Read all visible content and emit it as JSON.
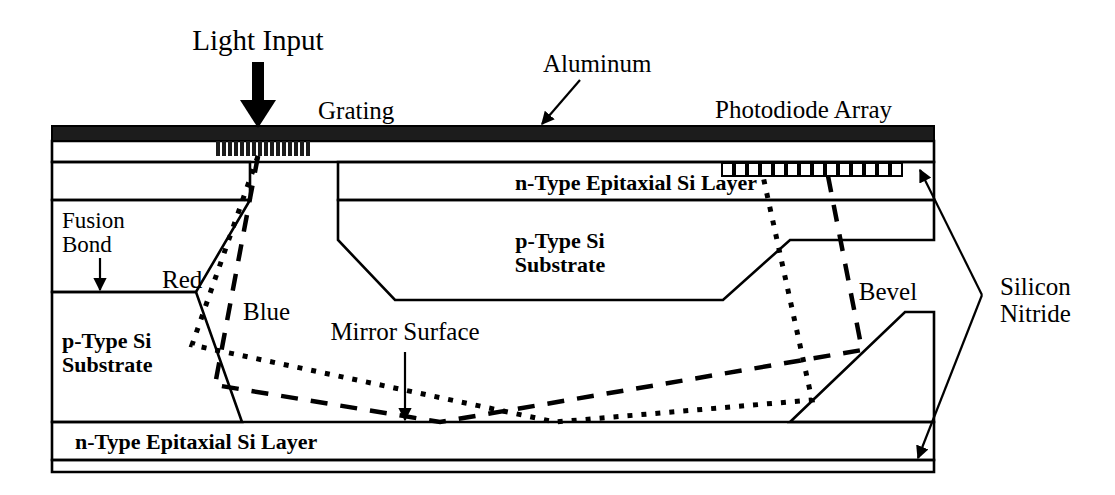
{
  "figure": {
    "kind": "cross-section-schematic",
    "background_color": "#ffffff",
    "ink_color": "#000000"
  },
  "labels": {
    "light_input": "Light Input",
    "grating": "Grating",
    "aluminum": "Aluminum",
    "photodiode_array": "Photodiode Array",
    "epi_top": "n-Type Epitaxial Si Layer",
    "epi_bottom": "n-Type Epitaxial Si Layer",
    "substrate_mid": "p-Type Si\nSubstrate",
    "substrate_mid_line1": "p-Type Si",
    "substrate_mid_line2": "Substrate",
    "substrate_left_line1": "p-Type Si",
    "substrate_left_line2": "Substrate",
    "fusion_bond_line1": "Fusion",
    "fusion_bond_line2": "Bond",
    "red_ray": "Red",
    "blue_ray": "Blue",
    "mirror_surface": "Mirror Surface",
    "bevel": "Bevel",
    "silicon_nitride_line1": "Silicon",
    "silicon_nitride_line2": "Nitride"
  },
  "colors": {
    "aluminum_fill": "#1c1c1c",
    "epi_layer_fill": "#d3d3d3",
    "substrate_fill": "#b4b4b4",
    "nitride_fill": "#ffffff",
    "outline": "#000000"
  },
  "counts": {
    "grating_teeth": 16,
    "photodiodes": 14
  },
  "rays": [
    {
      "name": "Red",
      "style": "dotted",
      "description": "Longer-wavelength ray diffracted at grating, reflects off left bevel, travels along mirror surface, reflects off right bevel up to photodiode array"
    },
    {
      "name": "Blue",
      "style": "dashed",
      "description": "Shorter-wavelength ray diffracted at grating at steeper angle, reflects off mirror surface and right bevel up to photodiode array"
    }
  ],
  "geometry_notes": {
    "device_left_x": 52,
    "device_right_x": 934,
    "aluminum_band_y": [
      126,
      141
    ],
    "top_epi_y": [
      162,
      200
    ],
    "mirror_surface_y": 422,
    "bottom_epi_y": [
      422,
      460
    ]
  }
}
